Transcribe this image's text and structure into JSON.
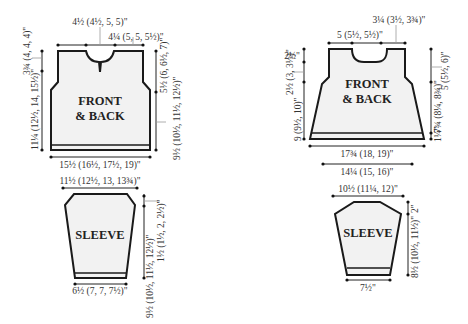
{
  "diagram": {
    "type": "knitting-schematic",
    "left": {
      "body": {
        "title_line1": "FRONT",
        "title_line2": "& BACK",
        "neck_width": "4½ (4½, 5, 5)\"",
        "shoulder_width": "4¼ (5, 5, 5½)\"",
        "armhole_depth_left": "3¾ (4, 4, 4)\"",
        "length_to_armhole_left": "11¼ (12½, 14, 15½)\"",
        "armhole_depth_right": "5½ (6, 6½, 7)\"",
        "length_to_armhole_right": "9½ (10½, 11½, 12½)\"",
        "bottom_width": "15½ (16½, 17½, 19)\""
      },
      "sleeve": {
        "title": "SLEEVE",
        "top_width": "11½ (12½, 13, 13¾)\"",
        "cap_height": "1½ (1½, 2, 2½)\"",
        "sleeve_length": "9½ (10½, 11½, 12½)\"",
        "cuff_width": "6½ (7, 7, 7½)\""
      }
    },
    "right": {
      "body": {
        "title_line1": "FRONT",
        "title_line2": "& BACK",
        "shoulder_width": "3¼ (3½, 3¾)\"",
        "neck_width": "5 (5½, 5½)\"",
        "neck_depth": "2½\"",
        "armhole_depth_left": "2½ (3, 3½)\"",
        "length_left": "9 (9½, 10)\"",
        "armhole_depth_right": "5 (5½, 6)\"",
        "length_right": "7¾ (8¼, 8¾)\"",
        "rib_height": "1¼\"",
        "bottom_width": "17¾ (18, 19)\"",
        "top_body_width": "14¼ (15, 16)\""
      },
      "sleeve": {
        "title": "SLEEVE",
        "top_width": "10½ (11¼, 12)\"",
        "cap_height": "2\"",
        "sleeve_length": "8½ (10½, 11½)\"",
        "cuff_width": "7½\""
      }
    }
  }
}
